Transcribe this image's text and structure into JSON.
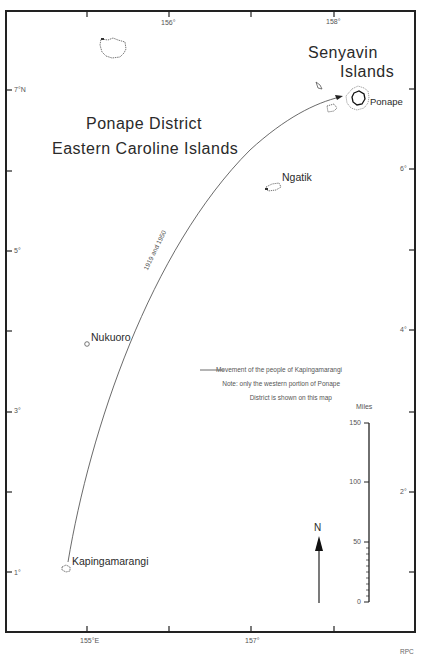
{
  "map": {
    "title_line1": "Ponape District",
    "title_line2": "Eastern Caroline Islands",
    "region_label_line1": "Senyavin",
    "region_label_line2": "Islands",
    "islands": [
      {
        "name": "Ponape"
      },
      {
        "name": "Ngatik"
      },
      {
        "name": "Nukuoro"
      },
      {
        "name": "Kapingamarangi"
      }
    ],
    "route": {
      "label": "1919 and 1950",
      "from": "Kapingamarangi",
      "to": "Ponape"
    },
    "longitude_ticks": {
      "top": [
        "156°",
        "158°"
      ],
      "bottom": [
        "155°E",
        "157°"
      ]
    },
    "latitude_ticks": {
      "left": [
        "7°N",
        "5°",
        "3°",
        "1°"
      ],
      "right": [
        "6°",
        "4°",
        "2°"
      ]
    },
    "legend": {
      "line_label": "Movement of the people of Kapingamarangi",
      "note_line1": "Note: only the western portion of Ponape",
      "note_line2": "District is shown on this map"
    },
    "scale_bar": {
      "unit": "Miles",
      "ticks": [
        "150",
        "100",
        "50",
        "0"
      ]
    },
    "north_arrow": {
      "label": "N"
    },
    "credit": "RPC",
    "colors": {
      "ink": "#2a2a2a",
      "frame": "#222222",
      "background": "#ffffff"
    }
  }
}
